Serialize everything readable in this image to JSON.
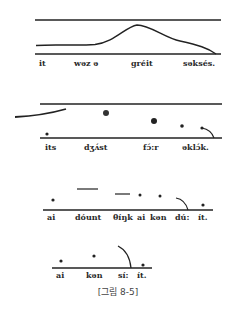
{
  "figure": {
    "caption": "[그림 8-5]",
    "ink_color": "#1e1e1e"
  },
  "panels": [
    {
      "id": "panel-1",
      "words": [
        "it",
        "wəz ə",
        "gréit",
        "səksés."
      ],
      "word_x": [
        39,
        74,
        131,
        183
      ]
    },
    {
      "id": "panel-2",
      "words": [
        "its",
        "dʒʌ́st",
        "fɔ́:r",
        "əklɔ́k."
      ],
      "word_x": [
        45,
        84,
        143,
        182
      ]
    },
    {
      "id": "panel-3",
      "words": [
        "ai",
        "dóunt",
        "θíŋk",
        "ai",
        "kən",
        "dú:",
        "ít."
      ],
      "word_x": [
        47,
        75,
        113,
        137,
        150,
        175,
        198
      ]
    },
    {
      "id": "panel-4",
      "words": [
        "ai",
        "kən",
        "sí:",
        "ít."
      ],
      "word_x": [
        56,
        86,
        118,
        137
      ]
    }
  ]
}
